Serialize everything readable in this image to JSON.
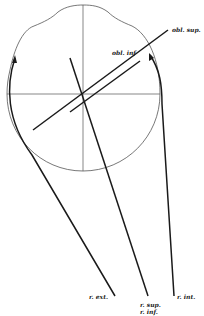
{
  "figure": {
    "colors": {
      "ink": "#1a1a1a",
      "thin": "#555555",
      "background": "#ffffff"
    },
    "labels": {
      "obl_sup": "obl. sup.",
      "obl_inf": "obl. inf",
      "r_ext": "r. ext.",
      "r_sup": "r. sup.",
      "r_inf_mid": "r. inf.",
      "r_int": "r. int."
    }
  }
}
